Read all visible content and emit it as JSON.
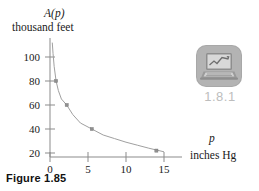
{
  "figure": {
    "caption": "Figure 1.85",
    "tech_icon": {
      "name": "laptop-chart-icon",
      "badge_color": "#b3b3b3",
      "number_label": "1.8.1",
      "number_color": "#bdbdbd"
    }
  },
  "chart_data": {
    "type": "line",
    "title": "",
    "subtitle": "",
    "ylabel": "A(p)",
    "ylabel_function": "A",
    "ylabel_variable": "p",
    "yunits": "thousand feet",
    "xlabel": "p",
    "xunits": "inches Hg",
    "xlim": [
      0,
      16.5
    ],
    "ylim": [
      14,
      115
    ],
    "xticks": [
      0,
      5,
      10,
      15
    ],
    "xtick_labels": [
      "0",
      "5",
      "10",
      "15"
    ],
    "yticks": [
      20,
      40,
      60,
      80,
      100
    ],
    "ytick_labels": [
      "20",
      "40",
      "60",
      "80",
      "100"
    ],
    "grid": false,
    "legend": null,
    "curve_color": "#a0a0a0",
    "axis_color": "#8b8b8b",
    "marker_color": "#8f8f8f",
    "series": [
      {
        "name": "altitude vs pressure",
        "x": [
          0.3,
          0.4,
          0.55,
          0.8,
          1.1,
          1.5,
          2.2,
          3.0,
          4.0,
          5.5,
          7.0,
          8.5,
          10.0,
          11.5,
          13.0,
          14.0,
          15.0
        ],
        "y": [
          112.0,
          103.0,
          92.0,
          80.0,
          72.0,
          65.0,
          60.0,
          52.0,
          45.0,
          40.0,
          35.0,
          32.0,
          29.0,
          26.5,
          24.0,
          22.5,
          21.0
        ]
      }
    ],
    "markers": [
      {
        "x": 0.8,
        "y": 80
      },
      {
        "x": 2.2,
        "y": 60
      },
      {
        "x": 5.5,
        "y": 40
      },
      {
        "x": 14.0,
        "y": 22
      }
    ]
  }
}
